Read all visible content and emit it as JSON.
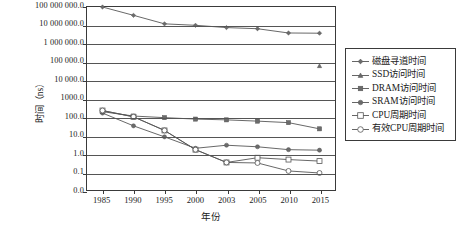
{
  "chart_data": {
    "type": "line",
    "title": "",
    "xlabel": "年份",
    "ylabel": "时间（ns）",
    "categories": [
      "1985",
      "1990",
      "1995",
      "2000",
      "2003",
      "2005",
      "2010",
      "2015"
    ],
    "yscale": "log",
    "ylim": [
      0.03,
      100000000.0
    ],
    "ytick_labels": [
      "100 000 000.0",
      "10 000 000.0",
      "1 000 000.0",
      "100 000.0",
      "10 000.0",
      "1000.0",
      "100.0",
      "10.0",
      "1.0",
      "0.1",
      "0.0"
    ],
    "ytick_values": [
      100000000.0,
      10000000.0,
      1000000.0,
      100000.0,
      10000.0,
      1000.0,
      100.0,
      10.0,
      1.0,
      0.1,
      0.03
    ],
    "grid": true,
    "legend_position": "right",
    "series": [
      {
        "name": "磁盘寻道时间",
        "marker": "diamond",
        "filled": true,
        "values": [
          100000000,
          35000000,
          12000000,
          10000000,
          7500000,
          6500000,
          3800000,
          3700000
        ]
      },
      {
        "name": "SSD访问时间",
        "marker": "triangle",
        "filled": true,
        "values": [
          null,
          null,
          null,
          null,
          null,
          null,
          null,
          60000
        ]
      },
      {
        "name": "DRAM访问时间",
        "marker": "square",
        "filled": true,
        "values": [
          190,
          110,
          90,
          75,
          68,
          58,
          48,
          22
        ]
      },
      {
        "name": "SRAM访问时间",
        "marker": "circle",
        "filled": true,
        "values": [
          160,
          32,
          8,
          1.9,
          2.8,
          2.3,
          1.6,
          1.5
        ]
      },
      {
        "name": "CPU周期时间",
        "marker": "square",
        "filled": false,
        "values": [
          220,
          100,
          18,
          1.6,
          0.32,
          0.58,
          0.46,
          0.38
        ]
      },
      {
        "name": "有效CPU周期时间",
        "marker": "circle",
        "filled": false,
        "values": [
          220,
          100,
          18,
          1.6,
          0.32,
          0.3,
          0.11,
          0.085
        ]
      }
    ]
  },
  "legend": {
    "items": [
      {
        "label": "磁盘寻道时间"
      },
      {
        "label": "SSD访问时间"
      },
      {
        "label": "DRAM访问时间"
      },
      {
        "label": "SRAM访问时间"
      },
      {
        "label": "CPU周期时间"
      },
      {
        "label": "有效CPU周期时间"
      }
    ]
  },
  "colors": {
    "line": "#555555",
    "axis": "#3a3a3a",
    "grid": "#555555",
    "background": "#ffffff",
    "marker_fill": "#6b6b6b",
    "marker_open": "#ffffff"
  }
}
